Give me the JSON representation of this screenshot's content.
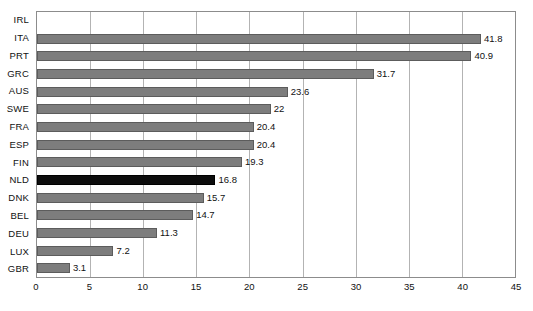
{
  "chart_data": {
    "type": "bar",
    "orientation": "horizontal",
    "title": "",
    "subtitle": "",
    "xlabel": "",
    "ylabel": "",
    "xlim": [
      0,
      45
    ],
    "xticks": [
      0,
      5,
      10,
      15,
      20,
      25,
      30,
      35,
      40,
      45
    ],
    "xtick_labels": [
      "0",
      "5",
      "10",
      "15",
      "20",
      "25",
      "30",
      "35",
      "40",
      "45"
    ],
    "grid": true,
    "grid_axis": "x",
    "legend": false,
    "legend_position": "none",
    "categories": [
      "IRL",
      "ITA",
      "PRT",
      "GRC",
      "AUS",
      "SWE",
      "FRA",
      "ESP",
      "FIN",
      "NLD",
      "DNK",
      "BEL",
      "DEU",
      "LUX",
      "GBR"
    ],
    "values": [
      null,
      41.8,
      40.9,
      31.7,
      23.6,
      22,
      20.4,
      20.4,
      19.3,
      16.8,
      15.7,
      14.7,
      11.3,
      7.2,
      3.1
    ],
    "value_labels": [
      "",
      "41.8",
      "40.9",
      "31.7",
      "23.6",
      "22",
      "20.4",
      "20.4",
      "19.3",
      "16.8",
      "15.7",
      "14.7",
      "11.3",
      "7.2",
      "3.1"
    ],
    "highlighted_category": "NLD",
    "bars": [
      {
        "category": "IRL",
        "value": null,
        "label": "",
        "highlight": false
      },
      {
        "category": "ITA",
        "value": 41.8,
        "label": "41.8",
        "highlight": false
      },
      {
        "category": "PRT",
        "value": 40.9,
        "label": "40.9",
        "highlight": false
      },
      {
        "category": "GRC",
        "value": 31.7,
        "label": "31.7",
        "highlight": false
      },
      {
        "category": "AUS",
        "value": 23.6,
        "label": "23.6",
        "highlight": false
      },
      {
        "category": "SWE",
        "value": 22,
        "label": "22",
        "highlight": false
      },
      {
        "category": "FRA",
        "value": 20.4,
        "label": "20.4",
        "highlight": false
      },
      {
        "category": "ESP",
        "value": 20.4,
        "label": "20.4",
        "highlight": false
      },
      {
        "category": "FIN",
        "value": 19.3,
        "label": "19.3",
        "highlight": false
      },
      {
        "category": "NLD",
        "value": 16.8,
        "label": "16.8",
        "highlight": true
      },
      {
        "category": "DNK",
        "value": 15.7,
        "label": "15.7",
        "highlight": false
      },
      {
        "category": "BEL",
        "value": 14.7,
        "label": "14.7",
        "highlight": false
      },
      {
        "category": "DEU",
        "value": 11.3,
        "label": "11.3",
        "highlight": false
      },
      {
        "category": "LUX",
        "value": 7.2,
        "label": "7.2",
        "highlight": false
      },
      {
        "category": "GBR",
        "value": 3.1,
        "label": "3.1",
        "highlight": false
      }
    ],
    "colors": {
      "bar": "#7d7d7d",
      "bar_border": "#5c5c5c",
      "bar_highlight": "#0d0d0d",
      "gridline": "#b3b3b3",
      "axis_border": "#8c8c8c",
      "background": "#ffffff",
      "text": "#111111"
    }
  }
}
